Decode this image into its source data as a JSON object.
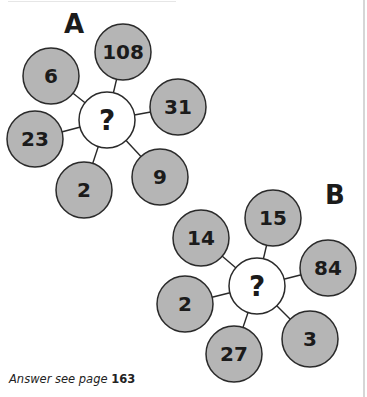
{
  "puzzles": [
    {
      "label": "A",
      "center": {
        "text": "?",
        "x": 107,
        "y": 120
      },
      "spokes": [
        {
          "value": "108",
          "x": 123,
          "y": 52
        },
        {
          "value": "31",
          "x": 178,
          "y": 107
        },
        {
          "value": "9",
          "x": 160,
          "y": 177
        },
        {
          "value": "2",
          "x": 84,
          "y": 190
        },
        {
          "value": "23",
          "x": 35,
          "y": 139
        },
        {
          "value": "6",
          "x": 51,
          "y": 76
        }
      ]
    },
    {
      "label": "B",
      "center": {
        "text": "?",
        "x": 257,
        "y": 286
      },
      "spokes": [
        {
          "value": "15",
          "x": 273,
          "y": 218
        },
        {
          "value": "84",
          "x": 328,
          "y": 268
        },
        {
          "value": "3",
          "x": 310,
          "y": 339
        },
        {
          "value": "27",
          "x": 234,
          "y": 354
        },
        {
          "value": "2",
          "x": 185,
          "y": 304
        },
        {
          "value": "14",
          "x": 201,
          "y": 238
        }
      ]
    }
  ],
  "footer": {
    "prefix": "Answer see page ",
    "page": "163"
  },
  "colors": {
    "spoke_fill": "#b5b5b5",
    "center_fill": "#ffffff",
    "stroke": "#2a2a2a",
    "text": "#1b1b1b"
  }
}
